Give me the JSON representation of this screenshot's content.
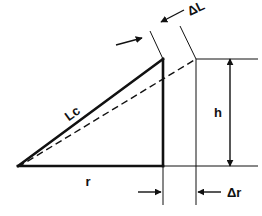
{
  "figure": {
    "kind": "engineering-line-diagram",
    "title": "",
    "background_color": "#ffffff",
    "line_color": "#111111"
  },
  "labels": {
    "hypotenuse": "Lc",
    "base": "r",
    "height": "h",
    "delta_length": "ΔL",
    "delta_radius": "Δr"
  },
  "geometry": {
    "units": "px",
    "left_vertex": [
      18,
      166
    ],
    "apex": [
      163,
      59
    ],
    "bottom_right_vertex": [
      163,
      166
    ],
    "dashed_end": [
      196,
      59
    ],
    "top_rule_y": 59,
    "bottom_rule_y": 166,
    "delta_r_left_x": 163,
    "delta_r_right_x": 196,
    "h_dimension_x": 230,
    "h_top_y": 59,
    "h_bottom_y": 166
  },
  "elements": [
    {
      "name": "triangle-hypotenuse",
      "label": "Lc",
      "style": "solid-thick"
    },
    {
      "name": "triangle-base",
      "label": "r",
      "style": "solid-thick"
    },
    {
      "name": "triangle-vertical-leg",
      "label": "",
      "style": "solid-thick"
    },
    {
      "name": "reference-dashed-line",
      "label": "",
      "style": "dashed"
    },
    {
      "name": "height-dimension",
      "label": "h",
      "style": "double-arrow-vertical"
    },
    {
      "name": "delta-length-dimension",
      "label": "ΔL",
      "style": "opposed-arrows-diagonal"
    },
    {
      "name": "delta-radius-dimension",
      "label": "Δr",
      "style": "opposed-arrows-horizontal"
    }
  ]
}
